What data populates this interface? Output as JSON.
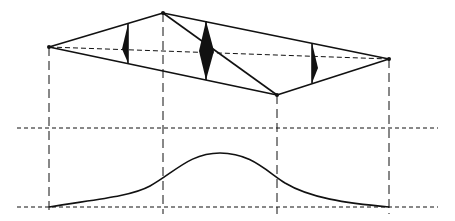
{
  "diagram": {
    "width": 455,
    "height": 221,
    "stroke_color": "#111111",
    "background": "#ffffff",
    "nodes": [
      {
        "id": "A",
        "x": 49,
        "y": 47
      },
      {
        "id": "B",
        "x": 163,
        "y": 13
      },
      {
        "id": "C",
        "x": 277,
        "y": 95
      },
      {
        "id": "D",
        "x": 389,
        "y": 59
      }
    ],
    "edges": [
      [
        "A",
        "B"
      ],
      [
        "B",
        "D"
      ],
      [
        "A",
        "C"
      ],
      [
        "C",
        "D"
      ],
      [
        "B",
        "C"
      ]
    ],
    "dashed_axis": [
      "A",
      "D"
    ],
    "markers": [
      {
        "x": 128,
        "top": 24,
        "bottom": 63,
        "tip": 122,
        "tip_y": 49,
        "side": "left"
      },
      {
        "x": 206,
        "top": 21,
        "bottom": 80,
        "tip_left": 199,
        "tip_right": 214,
        "tip_y": 51,
        "side": "both"
      },
      {
        "x": 312,
        "top": 43,
        "bottom": 83,
        "tip": 318,
        "tip_y": 68,
        "side": "right"
      }
    ],
    "projection_lines_x": [
      49,
      163,
      277,
      389
    ],
    "horizontal_guides_y": [
      128,
      207
    ],
    "profile_curve": {
      "baseline_y": 207,
      "peak_y": 153,
      "start_x": 49,
      "end_x": 389
    }
  }
}
